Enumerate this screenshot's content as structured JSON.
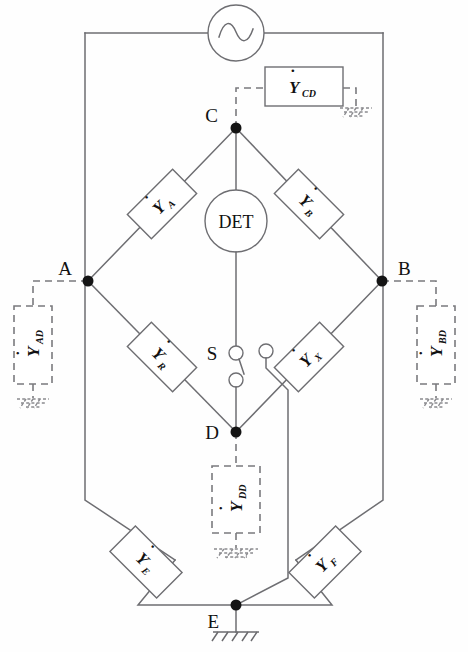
{
  "diagram": {
    "source": {
      "name": "oscillator",
      "symbol": "sine-wave",
      "label": "~"
    },
    "detector": {
      "label": "DET",
      "name": "null-detector"
    },
    "switch": {
      "label": "S",
      "name": "selector-switch",
      "poles": 3
    },
    "nodes": [
      {
        "id": "C",
        "label": "C",
        "x": 236,
        "y": 128
      },
      {
        "id": "A",
        "label": "A",
        "x": 88,
        "y": 281
      },
      {
        "id": "B",
        "label": "B",
        "x": 382,
        "y": 281
      },
      {
        "id": "D",
        "label": "D",
        "x": 236,
        "y": 432
      },
      {
        "id": "E",
        "label": "E",
        "x": 236,
        "y": 605
      }
    ],
    "arms": [
      {
        "id": "YA",
        "base": "Y",
        "sub": "A",
        "style": "solid",
        "between": [
          "C",
          "A"
        ]
      },
      {
        "id": "YB",
        "base": "Y",
        "sub": "B",
        "style": "solid",
        "between": [
          "C",
          "B"
        ]
      },
      {
        "id": "YR",
        "base": "Y",
        "sub": "R",
        "style": "solid",
        "between": [
          "A",
          "D"
        ]
      },
      {
        "id": "YX",
        "base": "Y",
        "sub": "X",
        "style": "solid",
        "between": [
          "B",
          "D"
        ]
      },
      {
        "id": "YE",
        "base": "Y",
        "sub": "E",
        "style": "solid",
        "between": [
          "A",
          "E"
        ]
      },
      {
        "id": "YF",
        "base": "Y",
        "sub": "F",
        "style": "solid",
        "between": [
          "B",
          "E"
        ]
      }
    ],
    "guards": [
      {
        "id": "YCD",
        "base": "Y",
        "sub": "CD",
        "style": "solid",
        "grounded": true,
        "from": "C"
      },
      {
        "id": "YAD",
        "base": "Y",
        "sub": "AD",
        "style": "dashed",
        "grounded": true,
        "from": "A"
      },
      {
        "id": "YBD",
        "base": "Y",
        "sub": "BD",
        "style": "dashed",
        "grounded": true,
        "from": "B"
      },
      {
        "id": "YDD",
        "base": "Y",
        "sub": "DD",
        "style": "dashed",
        "grounded": true,
        "from": "D"
      }
    ],
    "grounds": [
      {
        "at": "E",
        "style": "solid"
      },
      {
        "at": "YCD",
        "style": "dashed"
      },
      {
        "at": "YAD",
        "style": "dashed"
      },
      {
        "at": "YBD",
        "style": "dashed"
      },
      {
        "at": "YDD",
        "style": "dashed"
      }
    ],
    "colors": {
      "wire": "#6e6e72",
      "guard": "#7a7a7e",
      "node": "#141414",
      "text": "#111111",
      "background": "#fefefe"
    }
  }
}
